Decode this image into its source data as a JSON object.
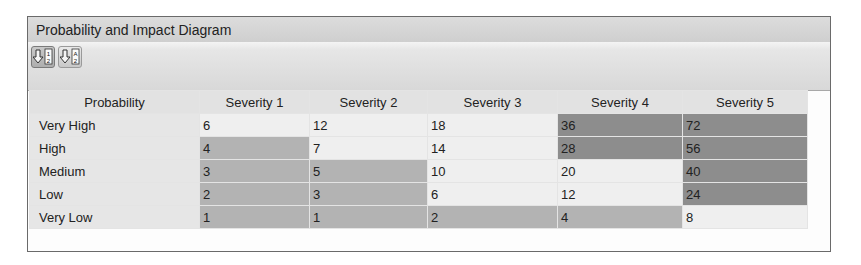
{
  "panel": {
    "title": "Probability and Impact Diagram"
  },
  "toolbar": {
    "buttons": [
      {
        "name": "sort-numeric",
        "icon": "sort-down-12-icon",
        "label": "1 2",
        "active": true
      },
      {
        "name": "sort-alpha",
        "icon": "sort-down-a2-icon",
        "label": "A 2",
        "active": false
      }
    ]
  },
  "table": {
    "columns": [
      "Probability",
      "Severity 1",
      "Severity 2",
      "Severity 3",
      "Severity 4",
      "Severity 5"
    ],
    "rows": [
      {
        "label": "Very High",
        "values": [
          "6",
          "12",
          "18",
          "36",
          "72"
        ],
        "levels": [
          1,
          1,
          1,
          3,
          3
        ]
      },
      {
        "label": "High",
        "values": [
          "4",
          "7",
          "14",
          "28",
          "56"
        ],
        "levels": [
          2,
          1,
          1,
          3,
          3
        ]
      },
      {
        "label": "Medium",
        "values": [
          "3",
          "5",
          "10",
          "20",
          "40"
        ],
        "levels": [
          2,
          2,
          1,
          1,
          3
        ]
      },
      {
        "label": "Low",
        "values": [
          "2",
          "3",
          "6",
          "12",
          "24"
        ],
        "levels": [
          2,
          2,
          1,
          1,
          3
        ]
      },
      {
        "label": "Very Low",
        "values": [
          "1",
          "1",
          "2",
          "4",
          "8"
        ],
        "levels": [
          2,
          2,
          2,
          2,
          1
        ]
      }
    ]
  },
  "colors": {
    "low": "#efefef",
    "medium": "#b3b3b3",
    "high": "#8d8d8d",
    "header": "#e2e2e2"
  }
}
